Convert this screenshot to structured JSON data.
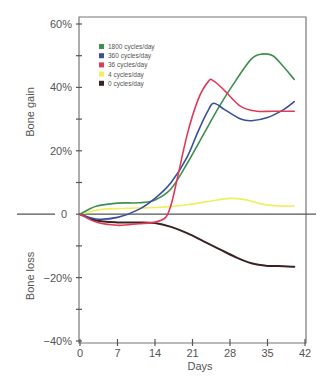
{
  "chart_data": {
    "type": "line",
    "title": "",
    "xlabel": "Days",
    "ylabel_top": "Bone gain",
    "ylabel_bottom": "Bone loss",
    "xlim": [
      0,
      42
    ],
    "ylim": [
      -40,
      60
    ],
    "x_ticks": [
      0,
      7,
      14,
      21,
      28,
      35,
      42
    ],
    "x_tick_labels": [
      "0",
      "7",
      "14",
      "21",
      "28",
      "35",
      "42"
    ],
    "y_ticks": [
      60,
      40,
      20,
      0,
      -20,
      -40
    ],
    "y_tick_labels": [
      "60%",
      "40%",
      "20%",
      "0",
      "−20%",
      "−40%"
    ],
    "y_minor_ticks": [
      50,
      30,
      10,
      -10,
      -30
    ],
    "grid": false,
    "legend_position": "upper-left",
    "series": [
      {
        "name": "1800 cycles/day",
        "color": "#3f8f4f",
        "x": [
          0,
          3,
          7,
          11,
          14,
          17,
          20,
          23,
          26,
          29,
          32,
          34,
          36,
          38,
          40
        ],
        "values": [
          0,
          2.5,
          3.5,
          3.6,
          4.5,
          8,
          16,
          25,
          34,
          42,
          49,
          50.5,
          50,
          46.5,
          42.5
        ]
      },
      {
        "name": "360 cycles/day",
        "color": "#3a4f9c",
        "x": [
          0,
          3,
          7,
          11,
          14,
          17,
          20,
          22,
          24,
          25,
          27,
          30,
          32,
          35,
          38,
          40
        ],
        "values": [
          0,
          -1.5,
          -1,
          1.5,
          5,
          10,
          18,
          26,
          33,
          35,
          33,
          30,
          29.5,
          30.5,
          33,
          35.5
        ]
      },
      {
        "name": "36 cycles/day",
        "color": "#e03a5a",
        "x": [
          0,
          3,
          7,
          11,
          14,
          16,
          17,
          18,
          20,
          22,
          24,
          25,
          27,
          30,
          33,
          36,
          40
        ],
        "values": [
          0,
          -2.5,
          -3.5,
          -3,
          -2.5,
          -1,
          3,
          10,
          25,
          36,
          42,
          42,
          39,
          34,
          32.5,
          32.5,
          32.5
        ]
      },
      {
        "name": "4 cycles/day",
        "color": "#eef060",
        "x": [
          0,
          4,
          8,
          12,
          16,
          20,
          24,
          28,
          31,
          34,
          37,
          40
        ],
        "values": [
          0,
          1.5,
          1.8,
          2,
          2.3,
          3,
          4,
          5,
          4.5,
          3.2,
          2.6,
          2.6
        ]
      },
      {
        "name": "0 cycles/day",
        "color": "#3a2222",
        "x": [
          0,
          3,
          7,
          11,
          14,
          17,
          20,
          23,
          26,
          29,
          32,
          35,
          38,
          40
        ],
        "values": [
          0,
          -2,
          -2.6,
          -2.6,
          -2.8,
          -4,
          -6,
          -8.5,
          -11,
          -13.5,
          -15.5,
          -16.3,
          -16.4,
          -16.6
        ]
      }
    ]
  }
}
